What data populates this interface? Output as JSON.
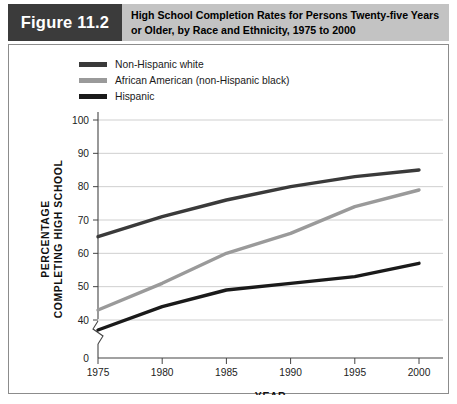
{
  "figure": {
    "badge_label": "Figure 11.2",
    "title": "High School Completion Rates for Persons Twenty-five Years or Older, by Race and Ethnicity, 1975 to 2000",
    "badge_bg": "#3b3b3b",
    "title_bg": "#c3c3c3",
    "border_color": "#8c8c8c"
  },
  "chart_data": {
    "type": "line",
    "title": "High School Completion Rates for Persons Twenty-five Years or Older, by Race and Ethnicity, 1975 to 2000",
    "xlabel": "YEAR",
    "ylabel": "PERCENTAGE COMPLETING HIGH SCHOOL",
    "ylabel_line1": "PERCENTAGE",
    "ylabel_line2": "COMPLETING HIGH SCHOOL",
    "x": [
      1975,
      1980,
      1985,
      1990,
      1995,
      2000
    ],
    "xtick_labels": [
      "1975",
      "1980",
      "1985",
      "1990",
      "1995",
      "2000"
    ],
    "ytick_labels": [
      "0",
      "40",
      "50",
      "60",
      "70",
      "80",
      "90",
      "100"
    ],
    "yticks": [
      0,
      40,
      50,
      60,
      70,
      80,
      90,
      100
    ],
    "ylim": [
      40,
      100
    ],
    "xlim": [
      1975,
      2000
    ],
    "axis_break": true,
    "axis_break_note": "zigzag break on y-axis between 0 and 40",
    "grid": "horizontal",
    "grid_color": "#cfcfcf",
    "legend_position": "above-plot-left",
    "series": [
      {
        "name": "Non-Hispanic white",
        "color": "#3a3a3a",
        "values": [
          65,
          71,
          76,
          80,
          83,
          85
        ]
      },
      {
        "name": "African American (non-Hispanic black)",
        "color": "#9a9a9a",
        "values": [
          43,
          51,
          60,
          66,
          74,
          79
        ]
      },
      {
        "name": "Hispanic",
        "color": "#1a1a1a",
        "values": [
          37,
          44,
          49,
          51,
          53,
          57
        ]
      }
    ]
  }
}
